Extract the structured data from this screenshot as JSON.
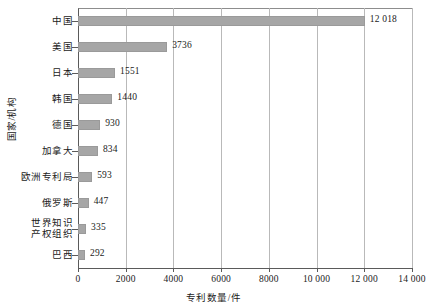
{
  "chart_data": {
    "type": "bar",
    "orientation": "horizontal",
    "title": "",
    "xlabel": "专利数量/件",
    "ylabel": "国家/机构",
    "categories": [
      "中国",
      "美国",
      "日本",
      "韩国",
      "德国",
      "加拿大",
      "欧洲专利局",
      "俄罗斯",
      "世界知识\n产权组织",
      "巴西"
    ],
    "values": [
      12018,
      3736,
      1551,
      1440,
      930,
      834,
      593,
      447,
      335,
      292
    ],
    "value_labels": [
      "12 018",
      "3736",
      "1551",
      "1440",
      "930",
      "834",
      "593",
      "447",
      "335",
      "292"
    ],
    "xlim": [
      0,
      14000
    ],
    "xticks": [
      0,
      2000,
      4000,
      6000,
      8000,
      10000,
      12000,
      14000
    ],
    "xtick_labels": [
      "0",
      "2000",
      "4000",
      "6000",
      "8000",
      "10 000",
      "12 000",
      "14 000"
    ],
    "grid": "vertical",
    "legend": null,
    "bar_color": "#a6a6a6",
    "grid_color": "#b9b9b9",
    "axis_color": "#5a5a5a",
    "background_color": "#ffffff"
  }
}
